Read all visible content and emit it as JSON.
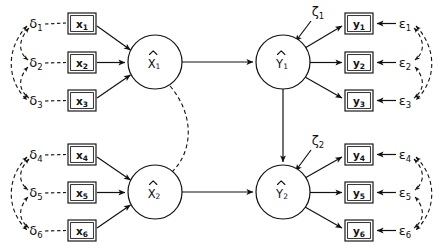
{
  "diagram": {
    "type": "sem-path-diagram",
    "background_color": "#ffffff",
    "line_color": "#111111"
  },
  "latent_variables": [
    {
      "id": "xi1",
      "label": "X",
      "subscript": "1",
      "hat": true,
      "kind": "exogenous",
      "cx": 155,
      "cy": 62,
      "r": 27
    },
    {
      "id": "xi2",
      "label": "X",
      "subscript": "2",
      "hat": true,
      "kind": "exogenous",
      "cx": 155,
      "cy": 192,
      "r": 27
    },
    {
      "id": "eta1",
      "label": "Y",
      "subscript": "1",
      "hat": true,
      "kind": "endogenous",
      "cx": 283,
      "cy": 62,
      "r": 27
    },
    {
      "id": "eta2",
      "label": "Y",
      "subscript": "2",
      "hat": true,
      "kind": "endogenous",
      "cx": 283,
      "cy": 192,
      "r": 27
    }
  ],
  "observed_x": [
    {
      "id": "x1",
      "label": "x",
      "subscript": "1",
      "x": 68,
      "y": 13,
      "w": 28,
      "h": 21
    },
    {
      "id": "x2",
      "label": "x",
      "subscript": "2",
      "x": 68,
      "y": 52,
      "w": 28,
      "h": 21
    },
    {
      "id": "x3",
      "label": "x",
      "subscript": "3",
      "x": 68,
      "y": 90,
      "w": 28,
      "h": 21
    },
    {
      "id": "x4",
      "label": "x",
      "subscript": "4",
      "x": 68,
      "y": 144,
      "w": 28,
      "h": 21
    },
    {
      "id": "x5",
      "label": "x",
      "subscript": "5",
      "x": 68,
      "y": 182,
      "w": 28,
      "h": 21
    },
    {
      "id": "x6",
      "label": "x",
      "subscript": "6",
      "x": 68,
      "y": 220,
      "w": 28,
      "h": 21
    }
  ],
  "observed_y": [
    {
      "id": "y1",
      "label": "y",
      "subscript": "1",
      "x": 345,
      "y": 13,
      "w": 28,
      "h": 21
    },
    {
      "id": "y2",
      "label": "y",
      "subscript": "2",
      "x": 345,
      "y": 52,
      "w": 28,
      "h": 21
    },
    {
      "id": "y3",
      "label": "y",
      "subscript": "3",
      "x": 345,
      "y": 90,
      "w": 28,
      "h": 21
    },
    {
      "id": "y4",
      "label": "y",
      "subscript": "4",
      "x": 345,
      "y": 144,
      "w": 28,
      "h": 21
    },
    {
      "id": "y5",
      "label": "y",
      "subscript": "5",
      "x": 345,
      "y": 182,
      "w": 28,
      "h": 21
    },
    {
      "id": "y6",
      "label": "y",
      "subscript": "6",
      "x": 345,
      "y": 220,
      "w": 28,
      "h": 21
    }
  ],
  "errors_delta": [
    {
      "id": "d1",
      "label": "δ",
      "subscript": "1",
      "x": 36,
      "y": 24
    },
    {
      "id": "d2",
      "label": "δ",
      "subscript": "2",
      "x": 36,
      "y": 63
    },
    {
      "id": "d3",
      "label": "δ",
      "subscript": "3",
      "x": 36,
      "y": 101
    },
    {
      "id": "d4",
      "label": "δ",
      "subscript": "4",
      "x": 36,
      "y": 155
    },
    {
      "id": "d5",
      "label": "δ",
      "subscript": "5",
      "x": 36,
      "y": 193
    },
    {
      "id": "d6",
      "label": "δ",
      "subscript": "6",
      "x": 36,
      "y": 231
    }
  ],
  "errors_epsilon": [
    {
      "id": "e1",
      "label": "ε",
      "subscript": "1",
      "x": 405,
      "y": 24
    },
    {
      "id": "e2",
      "label": "ε",
      "subscript": "2",
      "x": 405,
      "y": 63
    },
    {
      "id": "e3",
      "label": "ε",
      "subscript": "3",
      "x": 405,
      "y": 101
    },
    {
      "id": "e4",
      "label": "ε",
      "subscript": "4",
      "x": 405,
      "y": 155
    },
    {
      "id": "e5",
      "label": "ε",
      "subscript": "5",
      "x": 405,
      "y": 193
    },
    {
      "id": "e6",
      "label": "ε",
      "subscript": "6",
      "x": 405,
      "y": 231
    }
  ],
  "disturbances": [
    {
      "id": "z1",
      "label": "ζ",
      "subscript": "1",
      "x": 318,
      "y": 12
    },
    {
      "id": "z2",
      "label": "ζ",
      "subscript": "2",
      "x": 318,
      "y": 141
    }
  ],
  "structural_paths": [
    {
      "from": "xi1",
      "to": "eta1",
      "style": "solid"
    },
    {
      "from": "xi2",
      "to": "eta2",
      "style": "solid"
    },
    {
      "from": "eta1",
      "to": "eta2",
      "style": "solid"
    }
  ],
  "covariances": [
    {
      "between": [
        "xi1",
        "xi2"
      ],
      "style": "dashed"
    },
    {
      "between": [
        "d1",
        "d2"
      ],
      "style": "dashed"
    },
    {
      "between": [
        "d2",
        "d3"
      ],
      "style": "dashed"
    },
    {
      "between": [
        "d1",
        "d3"
      ],
      "style": "dashed"
    },
    {
      "between": [
        "d4",
        "d5"
      ],
      "style": "dashed"
    },
    {
      "between": [
        "d5",
        "d6"
      ],
      "style": "dashed"
    },
    {
      "between": [
        "d4",
        "d6"
      ],
      "style": "dashed"
    },
    {
      "between": [
        "e1",
        "e2"
      ],
      "style": "dashed"
    },
    {
      "between": [
        "e2",
        "e3"
      ],
      "style": "dashed"
    },
    {
      "between": [
        "e1",
        "e3"
      ],
      "style": "dashed"
    },
    {
      "between": [
        "e4",
        "e5"
      ],
      "style": "dashed"
    },
    {
      "between": [
        "e5",
        "e6"
      ],
      "style": "dashed"
    },
    {
      "between": [
        "e4",
        "e6"
      ],
      "style": "dashed"
    }
  ]
}
